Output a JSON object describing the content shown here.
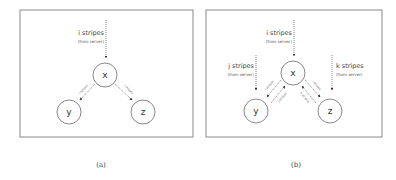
{
  "panels": [
    {
      "id": "a",
      "caption": "(a)",
      "nodes": {
        "x": "x",
        "y": "y",
        "z": "z"
      },
      "server_arrow": {
        "line1": "i stripes",
        "line2": "(from server)"
      },
      "edges": [
        {
          "from": "x",
          "to": "y",
          "label": "i stripes"
        },
        {
          "from": "x",
          "to": "z",
          "label": "i stripes"
        }
      ]
    },
    {
      "id": "b",
      "caption": "(b)",
      "nodes": {
        "x": "x",
        "y": "y",
        "z": "z"
      },
      "server_arrows": [
        {
          "target": "x",
          "line1": "i stripes",
          "line2": "(from server)"
        },
        {
          "target": "y",
          "line1": "j stripes",
          "line2": "(from server)"
        },
        {
          "target": "z",
          "line1": "k stripes",
          "line2": "(from server)"
        }
      ],
      "edges": [
        {
          "from": "x",
          "to": "y",
          "label": "i stripes"
        },
        {
          "from": "y",
          "to": "x",
          "label": "j stripes"
        },
        {
          "from": "x",
          "to": "z",
          "label": "i stripes"
        },
        {
          "from": "z",
          "to": "x",
          "label": "k stripes"
        }
      ]
    }
  ]
}
